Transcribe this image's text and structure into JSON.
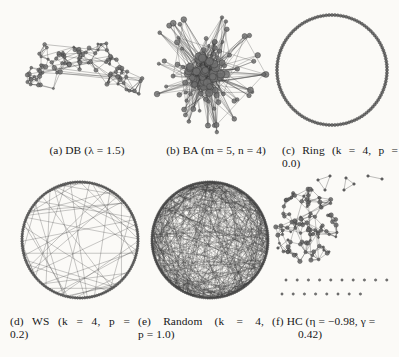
{
  "figure": {
    "kind": "network-graph-grid",
    "background_color": "#fbfaf7",
    "ink_color": "#3a3a3a",
    "panels": [
      {
        "id": "a",
        "label_line1": "(a) DB (λ = 1.5)",
        "label_line2": "",
        "model": "DB",
        "params": "λ = 1.5",
        "layout": "arc-shaped dense mesh"
      },
      {
        "id": "b",
        "label_line1": "(b) BA (m = 5, n = 4)",
        "label_line2": "",
        "model": "BA",
        "params": "m = 5, n = 4",
        "layout": "radial starburst with dense hub core"
      },
      {
        "id": "c",
        "label_line1": "(c) Ring (k = 4, p =",
        "label_line2": "0.0)",
        "model": "Ring",
        "params": "k = 4, p = 0.0",
        "layout": "regular circular ring lattice"
      },
      {
        "id": "d",
        "label_line1": "(d) WS (k = 4, p =",
        "label_line2": "0.2)",
        "model": "WS",
        "params": "k = 4, p = 0.2",
        "layout": "ring with rewired chords"
      },
      {
        "id": "e",
        "label_line1": "(e) Random (k = 4,",
        "label_line2": "p = 1.0)",
        "model": "Random",
        "params": "k = 4, p = 1.0",
        "layout": "fully rewired dense disc"
      },
      {
        "id": "f",
        "label_line1": "(f) HC (η = −0.98, γ =",
        "label_line2": "0.42)",
        "model": "HC",
        "params": "η = −0.98, γ = 0.42",
        "layout": "one giant cluster plus small fragments and isolated nodes"
      }
    ]
  }
}
